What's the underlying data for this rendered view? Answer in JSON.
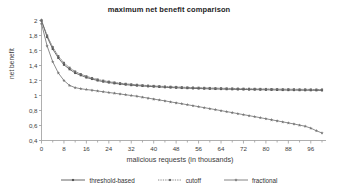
{
  "chart_data": {
    "type": "line",
    "title": "maximum net benefit comparison",
    "xlabel": "malicious requests (in thousands)",
    "ylabel": "net benefit",
    "xlim": [
      0,
      100
    ],
    "ylim": [
      0.4,
      2.0
    ],
    "grid": false,
    "legend_position": "bottom",
    "x_major_step": 8,
    "x_minor_step": 4,
    "y_step": 0.2,
    "decimal_separator": ",",
    "xticks": [
      0,
      8,
      16,
      24,
      32,
      40,
      48,
      56,
      64,
      72,
      80,
      88,
      96
    ],
    "xticklabels": [
      "0",
      "8",
      "16",
      "24",
      "32",
      "40",
      "48",
      "56",
      "64",
      "72",
      "80",
      "88",
      "96"
    ],
    "yticks": [
      0.4,
      0.6,
      0.8,
      1.0,
      1.2,
      1.4,
      1.6,
      1.8,
      2.0
    ],
    "yticklabels": [
      "0,4",
      "0,6",
      "0,8",
      "1",
      "1,2",
      "1,4",
      "1,6",
      "1,8",
      "2"
    ],
    "x": [
      0,
      2,
      4,
      6,
      8,
      10,
      12,
      14,
      16,
      18,
      20,
      22,
      24,
      26,
      28,
      30,
      32,
      34,
      36,
      38,
      40,
      42,
      44,
      46,
      48,
      50,
      52,
      54,
      56,
      58,
      60,
      62,
      64,
      66,
      68,
      70,
      72,
      74,
      76,
      78,
      80,
      82,
      84,
      86,
      88,
      90,
      92,
      94,
      96,
      98,
      100
    ],
    "series": [
      {
        "name": "threshold-based",
        "color": "#555555",
        "linestyle": "solid",
        "marker": "square",
        "values": [
          2.0,
          1.78,
          1.62,
          1.5,
          1.41,
          1.35,
          1.3,
          1.27,
          1.24,
          1.22,
          1.2,
          1.185,
          1.173,
          1.162,
          1.153,
          1.145,
          1.138,
          1.132,
          1.127,
          1.122,
          1.118,
          1.114,
          1.11,
          1.106,
          1.103,
          1.1,
          1.098,
          1.095,
          1.093,
          1.091,
          1.089,
          1.087,
          1.086,
          1.084,
          1.083,
          1.081,
          1.08,
          1.079,
          1.078,
          1.077,
          1.076,
          1.075,
          1.074,
          1.073,
          1.072,
          1.072,
          1.071,
          1.07,
          1.07,
          1.069,
          1.068
        ]
      },
      {
        "name": "cutoff",
        "color": "#6a6a6a",
        "linestyle": "dotted",
        "marker": "square",
        "values": [
          2.0,
          1.8,
          1.645,
          1.525,
          1.435,
          1.37,
          1.32,
          1.285,
          1.256,
          1.233,
          1.214,
          1.198,
          1.185,
          1.174,
          1.164,
          1.156,
          1.149,
          1.143,
          1.137,
          1.132,
          1.128,
          1.124,
          1.12,
          1.117,
          1.114,
          1.111,
          1.108,
          1.106,
          1.104,
          1.102,
          1.1,
          1.098,
          1.097,
          1.095,
          1.094,
          1.092,
          1.091,
          1.09,
          1.089,
          1.088,
          1.087,
          1.086,
          1.085,
          1.084,
          1.084,
          1.083,
          1.082,
          1.082,
          1.081,
          1.08,
          1.08
        ]
      },
      {
        "name": "fractional",
        "color": "#777777",
        "linestyle": "solid",
        "marker": "star",
        "values": [
          1.96,
          1.66,
          1.45,
          1.3,
          1.2,
          1.135,
          1.105,
          1.09,
          1.08,
          1.07,
          1.06,
          1.05,
          1.04,
          1.03,
          1.02,
          1.01,
          1.0,
          0.99,
          0.977,
          0.965,
          0.952,
          0.94,
          0.928,
          0.915,
          0.902,
          0.89,
          0.877,
          0.864,
          0.851,
          0.838,
          0.825,
          0.812,
          0.798,
          0.785,
          0.772,
          0.758,
          0.745,
          0.731,
          0.718,
          0.704,
          0.69,
          0.676,
          0.662,
          0.648,
          0.634,
          0.62,
          0.605,
          0.59,
          0.565,
          0.53,
          0.5
        ]
      }
    ]
  },
  "legend": {
    "entries": [
      {
        "label": "threshold-based"
      },
      {
        "label": "cutoff"
      },
      {
        "label": "fractional"
      }
    ]
  }
}
